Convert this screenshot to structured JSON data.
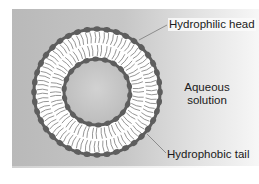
{
  "diagram": {
    "labels": {
      "hydrophilic_head": "Hydrophilic head",
      "aqueous_line1": "Aqueous",
      "aqueous_line2": "solution",
      "hydrophobic_tail": "Hydrophobic tail"
    },
    "colors": {
      "background": "#c2c2c2",
      "head": "#5e5e5e",
      "tail": "#8a8a8a",
      "core": "#c8c8c8",
      "bilayer_fill": "#ffffff",
      "leader_line": "#7a7a7a"
    },
    "geometry": {
      "center": [
        97,
        92
      ],
      "outer_head_radius": 63,
      "inner_head_radius": 33,
      "outer_head_count": 40,
      "inner_head_count": 22
    }
  }
}
